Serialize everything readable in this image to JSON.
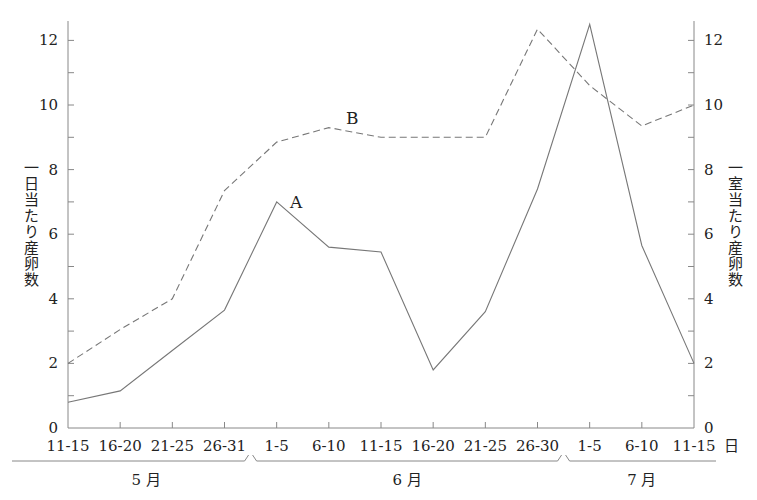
{
  "chart_data": {
    "type": "line",
    "title": "",
    "categories": [
      "11-15",
      "16-20",
      "21-25",
      "26-31",
      "1-5",
      "6-10",
      "11-15",
      "16-20",
      "21-25",
      "26-30",
      "1-5",
      "6-10",
      "11-15"
    ],
    "x_unit_label": "日",
    "month_groups": [
      {
        "label": "5 月",
        "start": 0,
        "end": 3
      },
      {
        "label": "6 月",
        "start": 4,
        "end": 9
      },
      {
        "label": "7 月",
        "start": 10,
        "end": 12
      }
    ],
    "series": [
      {
        "name": "A",
        "style": "solid",
        "axis": "left",
        "values": [
          0.8,
          1.15,
          2.4,
          3.65,
          7.0,
          5.6,
          5.45,
          1.8,
          3.6,
          7.4,
          12.5,
          5.65,
          2.0
        ]
      },
      {
        "name": "B",
        "style": "dashed",
        "axis": "right",
        "values": [
          2.0,
          3.05,
          4.0,
          7.35,
          8.85,
          9.3,
          9.0,
          9.0,
          9.0,
          12.35,
          10.6,
          9.35,
          10.0
        ]
      }
    ],
    "ylabel_left": "一日当たり産卵数",
    "ylabel_right": "一室当たり産卵数",
    "ylim": [
      0,
      12.6
    ],
    "yticks_major": [
      0,
      2,
      4,
      6,
      8,
      10,
      12
    ],
    "yticks_minor": [
      1,
      3,
      5,
      7,
      9,
      11
    ],
    "grid": false,
    "legend": "inline labels A and B near lines"
  },
  "labels": {
    "ylabel_left": "一日当たり産卵数",
    "ylabel_right": "一室当たり産卵数"
  },
  "colors": {
    "line": "#777777",
    "axis": "#888888",
    "text": "#222222"
  }
}
